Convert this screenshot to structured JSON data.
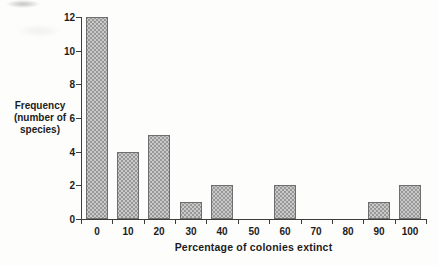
{
  "chart_data": {
    "type": "bar",
    "title": "",
    "xlabel": "Percentage of colonies extinct",
    "ylabel": "Frequency (number of species)",
    "ylabel_lines": [
      "Frequency",
      "(number of",
      "species)"
    ],
    "categories": [
      "0",
      "10",
      "20",
      "30",
      "40",
      "50",
      "60",
      "70",
      "80",
      "90",
      "100"
    ],
    "values": [
      12,
      4,
      5,
      1,
      2,
      0,
      2,
      0,
      0,
      1,
      2
    ],
    "ylim": [
      0,
      12
    ],
    "yticks": [
      0,
      2,
      4,
      6,
      8,
      10,
      12
    ],
    "grid": false,
    "legend": "none",
    "colors": {
      "bar_fill": "#c9c9c9",
      "bar_dot": "#989898",
      "bar_border": "#6e6e6e",
      "axis": "#3d3d3d",
      "text": "#1c1c1c",
      "background": "#fdfdfc"
    }
  }
}
